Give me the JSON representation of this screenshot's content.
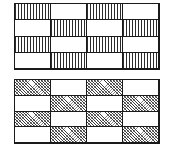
{
  "figure_set": {
    "description": "Two rectangular grid diagrams showing checkerboard hatch patterns",
    "background_color": "#ffffff",
    "line_color": "#1a1a1a"
  },
  "figures": [
    {
      "id": "figure-top",
      "name": "vertical-hatch-checkerboard",
      "rows": 4,
      "columns": 4,
      "hatch_style": "vertical-lines",
      "hatch_color": "#2b2b2b",
      "cells": [
        [
          "hatched",
          "blank",
          "hatched",
          "blank"
        ],
        [
          "blank",
          "hatched",
          "blank",
          "hatched"
        ],
        [
          "hatched",
          "blank",
          "hatched",
          "blank"
        ],
        [
          "blank",
          "hatched",
          "blank",
          "hatched"
        ]
      ]
    },
    {
      "id": "figure-bottom",
      "name": "diagonal-hatch-checkerboard",
      "rows": 4,
      "columns": 4,
      "hatch_style": "diagonal-crosshatch",
      "hatch_color": "#3a3a3a",
      "cells": [
        [
          "hatched",
          "blank",
          "hatched",
          "blank"
        ],
        [
          "blank",
          "hatched",
          "blank",
          "hatched"
        ],
        [
          "hatched",
          "blank",
          "hatched",
          "blank"
        ],
        [
          "blank",
          "hatched",
          "blank",
          "hatched"
        ]
      ]
    }
  ]
}
